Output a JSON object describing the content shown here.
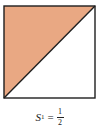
{
  "diagram": {
    "type": "unit-square-shaded-triangle",
    "square": {
      "x": 4,
      "y": 6,
      "width": 91,
      "height": 92
    },
    "shaded_region": "upper-left triangle",
    "diagonal": "bottom-left to top-right",
    "colors": {
      "fill": "#E9A883",
      "stroke": "#1f1f1f",
      "background": "#ffffff"
    }
  },
  "caption": {
    "variable": "S",
    "subscript": "1",
    "equals": "=",
    "numerator": "1",
    "denominator": "2"
  }
}
